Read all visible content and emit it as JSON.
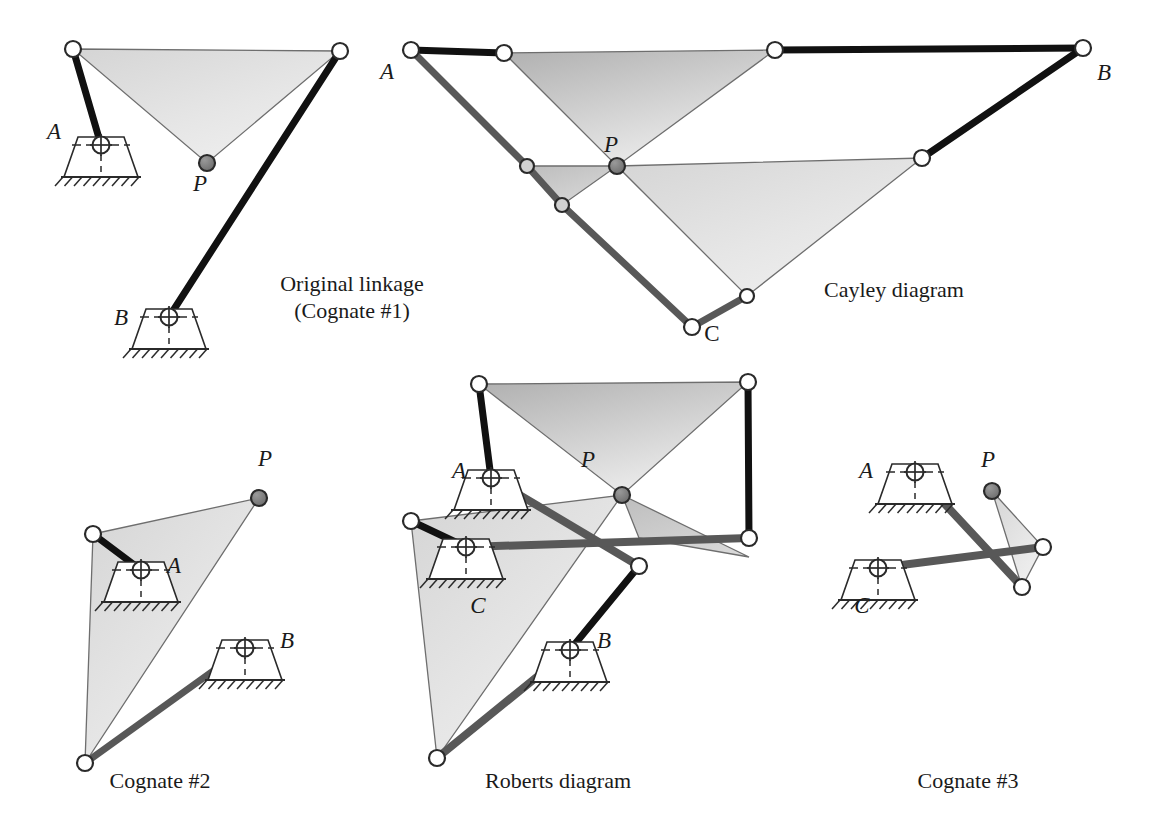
{
  "figure": {
    "background": "#ffffff",
    "width": 1165,
    "height": 840
  },
  "colors": {
    "link_black": "#111111",
    "link_gray": "#585858",
    "coupler_fill_dark": "#b9b9b9",
    "coupler_fill_mid": "#cfcfcf",
    "coupler_fill_light": "#e2e2e2",
    "coupler_stroke": "#6e6e6e",
    "joint_open_fill": "#ffffff",
    "joint_open_stroke": "#2a2a2a",
    "joint_p_fill": "#7a7a7a",
    "joint_p_stroke": "#2a2a2a",
    "ground_stroke": "#2a2a2a",
    "text": "#1a1a1a"
  },
  "panels": [
    {
      "id": "original-linkage",
      "caption_lines": [
        "Original linkage",
        "(Cognate #1)"
      ],
      "caption_x": 352,
      "caption_y": 291,
      "labels": [
        {
          "name": "label-A",
          "text": "A",
          "x": 54,
          "y": 139,
          "italic": true
        },
        {
          "name": "label-B",
          "text": "B",
          "x": 121,
          "y": 325,
          "italic": true
        },
        {
          "name": "label-P",
          "text": "P",
          "x": 200,
          "y": 191,
          "italic": true
        }
      ],
      "coupler": {
        "name": "coupler-triangle",
        "points": "73,49 340,51 207,163",
        "fill": "light"
      },
      "links": [
        {
          "name": "link-crank-A",
          "x1": 73,
          "y1": 49,
          "x2": 101,
          "y2": 145,
          "color": "black",
          "w": 7
        },
        {
          "name": "link-crank-B",
          "x1": 340,
          "y1": 51,
          "x2": 169,
          "y2": 317,
          "color": "black",
          "w": 7
        }
      ],
      "grounds": [
        {
          "name": "ground-pivot-A",
          "x": 101,
          "y": 145,
          "rot": 0
        },
        {
          "name": "ground-pivot-B",
          "x": 169,
          "y": 317,
          "rot": 0
        }
      ],
      "joints": [
        {
          "name": "joint-open-1",
          "x": 73,
          "y": 49,
          "type": "open",
          "r": 8
        },
        {
          "name": "joint-open-2",
          "x": 340,
          "y": 51,
          "type": "open",
          "r": 8
        },
        {
          "name": "joint-coupler-P",
          "x": 207,
          "y": 163,
          "type": "tracer",
          "r": 8
        }
      ]
    },
    {
      "id": "cayley-diagram",
      "caption_lines": [
        "Cayley diagram"
      ],
      "caption_x": 894,
      "caption_y": 297,
      "labels": [
        {
          "name": "label-A",
          "text": "A",
          "x": 387,
          "y": 79,
          "italic": true
        },
        {
          "name": "label-B",
          "text": "B",
          "x": 1104,
          "y": 80,
          "italic": true
        },
        {
          "name": "label-C",
          "text": "C",
          "x": 712,
          "y": 341,
          "italic": false
        },
        {
          "name": "label-P",
          "text": "P",
          "x": 611,
          "y": 152,
          "italic": true
        }
      ],
      "couplers": [
        {
          "name": "coupler-triangle-top",
          "points": "504,53 775,50 617,166",
          "fill": "dark"
        },
        {
          "name": "coupler-triangle-right",
          "points": "617,166 922,158 747,296",
          "fill": "light"
        },
        {
          "name": "coupler-triangle-left",
          "points": "617,166 527,166 562,205",
          "fill": "mid"
        }
      ],
      "links": [
        {
          "name": "link-A-top",
          "x1": 411,
          "y1": 50,
          "x2": 504,
          "y2": 53,
          "color": "black",
          "w": 7
        },
        {
          "name": "link-top-B",
          "x1": 775,
          "y1": 50,
          "x2": 1083,
          "y2": 48,
          "color": "black",
          "w": 7
        },
        {
          "name": "link-A-left",
          "x1": 411,
          "y1": 50,
          "x2": 527,
          "y2": 166,
          "color": "gray",
          "w": 7
        },
        {
          "name": "link-left-lower",
          "x1": 527,
          "y1": 166,
          "x2": 562,
          "y2": 205,
          "color": "gray",
          "w": 7
        },
        {
          "name": "link-lower-C",
          "x1": 562,
          "y1": 205,
          "x2": 692,
          "y2": 327,
          "color": "gray",
          "w": 7
        },
        {
          "name": "link-C-right",
          "x1": 692,
          "y1": 327,
          "x2": 747,
          "y2": 296,
          "color": "gray",
          "w": 7
        },
        {
          "name": "link-right-B",
          "x1": 922,
          "y1": 158,
          "x2": 1083,
          "y2": 48,
          "color": "black",
          "w": 7
        }
      ],
      "grounds": [],
      "joints": [
        {
          "name": "joint-A",
          "x": 411,
          "y": 50,
          "type": "open",
          "r": 8
        },
        {
          "name": "joint-top-left",
          "x": 504,
          "y": 53,
          "type": "open",
          "r": 8
        },
        {
          "name": "joint-top-right",
          "x": 775,
          "y": 50,
          "type": "open",
          "r": 8
        },
        {
          "name": "joint-B",
          "x": 1083,
          "y": 48,
          "type": "open",
          "r": 8
        },
        {
          "name": "joint-mid-left",
          "x": 527,
          "y": 166,
          "type": "gray",
          "r": 7
        },
        {
          "name": "joint-lower-left",
          "x": 562,
          "y": 205,
          "type": "gray",
          "r": 7
        },
        {
          "name": "joint-C",
          "x": 692,
          "y": 327,
          "type": "open",
          "r": 8
        },
        {
          "name": "joint-C-right",
          "x": 747,
          "y": 296,
          "type": "open",
          "r": 7
        },
        {
          "name": "joint-mid-right",
          "x": 922,
          "y": 158,
          "type": "open",
          "r": 8
        },
        {
          "name": "joint-P",
          "x": 617,
          "y": 166,
          "type": "tracer",
          "r": 8
        }
      ]
    },
    {
      "id": "cognate-2",
      "caption_lines": [
        "Cognate #2"
      ],
      "caption_x": 160,
      "caption_y": 788,
      "labels": [
        {
          "name": "label-A",
          "text": "A",
          "x": 174,
          "y": 573,
          "italic": true
        },
        {
          "name": "label-B",
          "text": "B",
          "x": 287,
          "y": 648,
          "italic": true
        },
        {
          "name": "label-P",
          "text": "P",
          "x": 265,
          "y": 466,
          "italic": true
        }
      ],
      "coupler": {
        "name": "coupler-triangle",
        "points": "93,534 259,498 85,763",
        "fill": "light"
      },
      "links": [
        {
          "name": "link-crank-A",
          "x1": 93,
          "y1": 534,
          "x2": 141,
          "y2": 570,
          "color": "black",
          "w": 7
        },
        {
          "name": "link-crank-B",
          "x1": 85,
          "y1": 763,
          "x2": 245,
          "y2": 648,
          "color": "gray",
          "w": 7
        }
      ],
      "grounds": [
        {
          "name": "ground-pivot-A",
          "x": 141,
          "y": 570,
          "rot": 0
        },
        {
          "name": "ground-pivot-B",
          "x": 245,
          "y": 648,
          "rot": 0
        }
      ],
      "joints": [
        {
          "name": "joint-open-1",
          "x": 93,
          "y": 534,
          "type": "open",
          "r": 8
        },
        {
          "name": "joint-open-2",
          "x": 85,
          "y": 763,
          "type": "open",
          "r": 8
        },
        {
          "name": "joint-coupler-P",
          "x": 259,
          "y": 498,
          "type": "tracer",
          "r": 8
        }
      ]
    },
    {
      "id": "roberts-diagram",
      "caption_lines": [
        "Roberts diagram"
      ],
      "caption_x": 558,
      "caption_y": 788,
      "labels": [
        {
          "name": "label-A",
          "text": "A",
          "x": 459,
          "y": 478,
          "italic": true
        },
        {
          "name": "label-B",
          "text": "B",
          "x": 604,
          "y": 648,
          "italic": true
        },
        {
          "name": "label-C",
          "text": "C",
          "x": 478,
          "y": 613,
          "italic": true
        },
        {
          "name": "label-P",
          "text": "P",
          "x": 588,
          "y": 467,
          "italic": true
        }
      ],
      "couplers": [
        {
          "name": "coupler-triangle-top",
          "points": "479,384 748,382 622,495",
          "fill": "dark"
        },
        {
          "name": "coupler-triangle-left",
          "points": "411,521 622,495 437,758",
          "fill": "light"
        },
        {
          "name": "coupler-triangle-right",
          "points": "622,495 639,538 749,557",
          "fill": "mid"
        }
      ],
      "links": [
        {
          "name": "link-A-crank",
          "x1": 479,
          "y1": 384,
          "x2": 491,
          "y2": 478,
          "color": "black",
          "w": 7
        },
        {
          "name": "link-A-long",
          "x1": 491,
          "y1": 478,
          "x2": 639,
          "y2": 566,
          "color": "gray",
          "w": 8
        },
        {
          "name": "link-C-crank",
          "x1": 411,
          "y1": 521,
          "x2": 466,
          "y2": 547,
          "color": "black",
          "w": 7
        },
        {
          "name": "link-C-long",
          "x1": 466,
          "y1": 547,
          "x2": 749,
          "y2": 538,
          "color": "gray",
          "w": 8
        },
        {
          "name": "link-B-crank",
          "x1": 437,
          "y1": 758,
          "x2": 570,
          "y2": 650,
          "color": "gray",
          "w": 8
        },
        {
          "name": "link-B-upper",
          "x1": 570,
          "y1": 650,
          "x2": 639,
          "y2": 566,
          "color": "black",
          "w": 7
        },
        {
          "name": "link-right-upper",
          "x1": 748,
          "y1": 382,
          "x2": 749,
          "y2": 538,
          "color": "black",
          "w": 7
        }
      ],
      "grounds": [
        {
          "name": "ground-pivot-A",
          "x": 491,
          "y": 478,
          "rot": 0
        },
        {
          "name": "ground-pivot-C",
          "x": 466,
          "y": 547,
          "rot": 0
        },
        {
          "name": "ground-pivot-B",
          "x": 570,
          "y": 650,
          "rot": 0
        }
      ],
      "joints": [
        {
          "name": "joint-top-left",
          "x": 479,
          "y": 384,
          "type": "open",
          "r": 8
        },
        {
          "name": "joint-top-right",
          "x": 748,
          "y": 382,
          "type": "open",
          "r": 8
        },
        {
          "name": "joint-left",
          "x": 411,
          "y": 521,
          "type": "open",
          "r": 8
        },
        {
          "name": "joint-bottom-left",
          "x": 437,
          "y": 758,
          "type": "open",
          "r": 8
        },
        {
          "name": "joint-right-mid",
          "x": 749,
          "y": 538,
          "type": "open",
          "r": 8
        },
        {
          "name": "joint-lower-mid",
          "x": 639,
          "y": 566,
          "type": "open",
          "r": 8
        },
        {
          "name": "joint-P",
          "x": 622,
          "y": 495,
          "type": "tracer",
          "r": 8
        }
      ]
    },
    {
      "id": "cognate-3",
      "caption_lines": [
        "Cognate #3"
      ],
      "caption_x": 968,
      "caption_y": 788,
      "labels": [
        {
          "name": "label-A",
          "text": "A",
          "x": 866,
          "y": 478,
          "italic": true
        },
        {
          "name": "label-C",
          "text": "C",
          "x": 862,
          "y": 613,
          "italic": true
        },
        {
          "name": "label-P",
          "text": "P",
          "x": 988,
          "y": 467,
          "italic": true
        }
      ],
      "coupler": {
        "name": "coupler-triangle",
        "points": "992,491 1043,547 1022,587",
        "fill": "light"
      },
      "links": [
        {
          "name": "link-A-crank",
          "x1": 915,
          "y1": 472,
          "x2": 1022,
          "y2": 587,
          "color": "gray",
          "w": 8
        },
        {
          "name": "link-C-crank",
          "x1": 878,
          "y1": 568,
          "x2": 1043,
          "y2": 547,
          "color": "gray",
          "w": 8
        }
      ],
      "grounds": [
        {
          "name": "ground-pivot-A",
          "x": 915,
          "y": 472,
          "rot": 0
        },
        {
          "name": "ground-pivot-C",
          "x": 878,
          "y": 568,
          "rot": 0
        }
      ],
      "joints": [
        {
          "name": "joint-right",
          "x": 1043,
          "y": 547,
          "type": "open",
          "r": 8
        },
        {
          "name": "joint-bottom",
          "x": 1022,
          "y": 587,
          "type": "open",
          "r": 8
        },
        {
          "name": "joint-P",
          "x": 992,
          "y": 491,
          "type": "tracer",
          "r": 8
        }
      ]
    }
  ]
}
